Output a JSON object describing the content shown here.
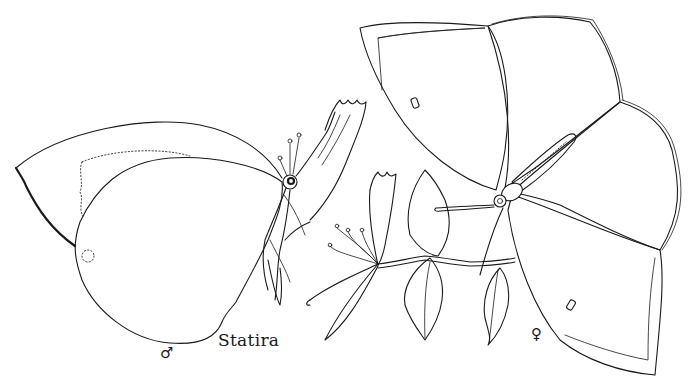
{
  "illustration": {
    "caption": "Statira",
    "subjects": [
      {
        "name": "male-butterfly",
        "view": "lateral, wings closed",
        "symbol": "♂"
      },
      {
        "name": "female-butterfly",
        "view": "dorsal, wings open",
        "symbol": "♀"
      },
      {
        "name": "honeysuckle-branch",
        "view": "flowers and leaves"
      }
    ],
    "style": "black line drawing on white",
    "colors": {
      "ink": "#1a1a1a",
      "paper": "#ffffff"
    }
  }
}
